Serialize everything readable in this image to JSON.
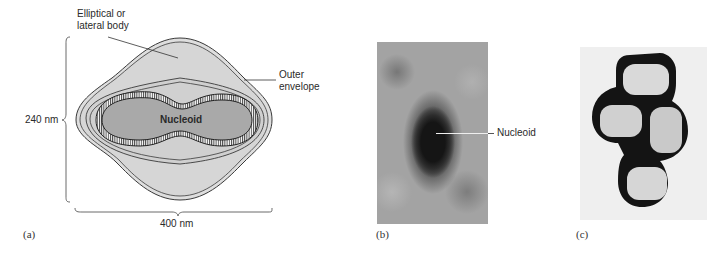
{
  "figure": {
    "panels": [
      {
        "id": "a",
        "panel_label": "(a)",
        "type": "schematic",
        "labels": {
          "lateral_body": [
            "Elliptical or",
            "lateral body"
          ],
          "outer_envelope": [
            "Outer",
            "envelope"
          ],
          "nucleoid": "Nucleoid",
          "height": "240 nm",
          "width": "400 nm"
        }
      },
      {
        "id": "b",
        "panel_label": "(b)",
        "type": "micrograph",
        "labels": {
          "nucleoid": "Nucleoid"
        }
      },
      {
        "id": "c",
        "panel_label": "(c)",
        "type": "micrograph"
      }
    ],
    "colors": {
      "body_fill": "#dcdcdc",
      "nucleoid_fill": "#a9a9a9",
      "outline": "#3a3a3a",
      "photo_b_bg": "#9a9a9a",
      "photo_c_bg": "#f0f0f0"
    }
  }
}
